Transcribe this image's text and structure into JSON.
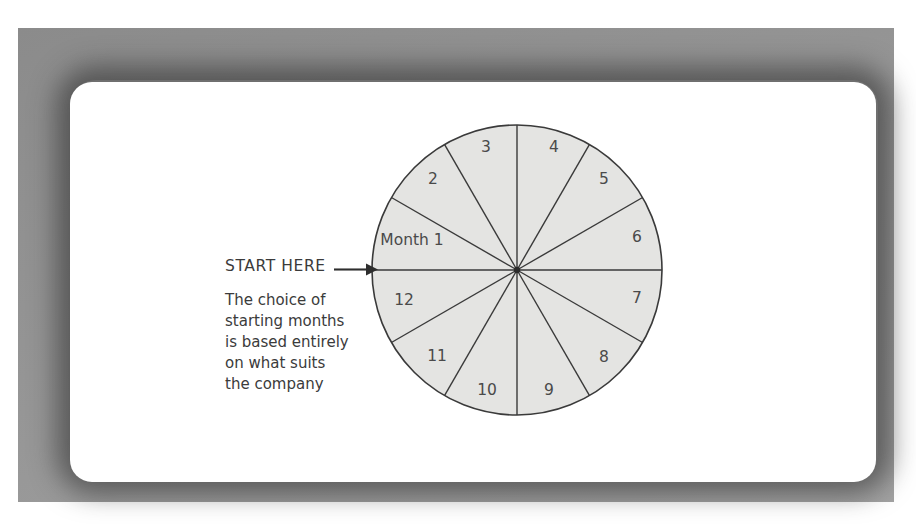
{
  "figure": {
    "frame_color": "#909090",
    "panel_color": "#ffffff"
  },
  "callout": {
    "start_label": "START HERE",
    "arrow_icon": "right-arrow-icon",
    "body_lines": [
      "The choice of",
      "starting months",
      "is based entirely",
      "on what suits",
      "the company"
    ]
  },
  "chart_data": {
    "type": "pie",
    "title": "",
    "subtitle": "",
    "xlabel": "",
    "ylabel": "",
    "legend_position": "none",
    "grid": false,
    "start_angle_deg": 180,
    "direction": "clockwise",
    "equal_slices": true,
    "slice_angle_deg": 30,
    "fill_color": "#e4e4e2",
    "stroke_color": "#3a3a3a",
    "center": {
      "x": 517,
      "y": 270
    },
    "radius": 145,
    "categories": [
      "Month 1",
      "2",
      "3",
      "4",
      "5",
      "6",
      "7",
      "8",
      "9",
      "10",
      "11",
      "12"
    ],
    "values": [
      8.333,
      8.333,
      8.333,
      8.333,
      8.333,
      8.333,
      8.333,
      8.333,
      8.333,
      8.333,
      8.333,
      8.333
    ],
    "labels": [
      {
        "text": "Month 1",
        "x": 412,
        "y": 245
      },
      {
        "text": "2",
        "x": 433,
        "y": 184
      },
      {
        "text": "3",
        "x": 486,
        "y": 152
      },
      {
        "text": "4",
        "x": 554,
        "y": 152
      },
      {
        "text": "5",
        "x": 604,
        "y": 184
      },
      {
        "text": "6",
        "x": 637,
        "y": 242
      },
      {
        "text": "7",
        "x": 637,
        "y": 303
      },
      {
        "text": "8",
        "x": 604,
        "y": 362
      },
      {
        "text": "9",
        "x": 549,
        "y": 395
      },
      {
        "text": "10",
        "x": 487,
        "y": 395
      },
      {
        "text": "11",
        "x": 437,
        "y": 361
      },
      {
        "text": "12",
        "x": 404,
        "y": 305
      }
    ],
    "annotations": [
      {
        "name": "start-here-arrow",
        "text": "START HERE",
        "points_to": "Month 1 boundary at 180 degrees"
      }
    ]
  }
}
